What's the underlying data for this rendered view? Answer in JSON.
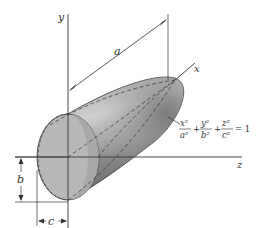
{
  "diagram": {
    "type": "ellipsoid-figure",
    "axes": {
      "x": "x",
      "y": "y",
      "z": "z"
    },
    "dimensions": {
      "a": "a",
      "b": "b",
      "c": "c"
    },
    "equation": {
      "t1_num": "x²",
      "t1_den": "a²",
      "t2_num": "y²",
      "t2_den": "b²",
      "t3_num": "z²",
      "t3_den": "c²",
      "plus": "+",
      "rhs": "= 1"
    },
    "colors": {
      "line": "#333333",
      "shape_dark": "#6e6e6e",
      "shape_light": "#c8c8c8",
      "end_face": "#b5b5b5"
    }
  }
}
